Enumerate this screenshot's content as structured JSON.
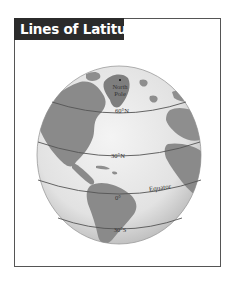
{
  "title": "Lines of Latitude",
  "globe": {
    "labels": {
      "north_pole_line1": "North",
      "north_pole_line2": "Pole",
      "lat_60n": "60°N",
      "lat_30n": "30°N",
      "equator_name": "Equator",
      "lat_0": "0°",
      "lat_30s": "30°S"
    }
  },
  "colors": {
    "title_bg": "#2b2b2b",
    "title_fg": "#ffffff",
    "frame_border": "#555555",
    "ocean": "#e9e9e9",
    "land": "#8a8a8a",
    "lines": "#555555"
  }
}
